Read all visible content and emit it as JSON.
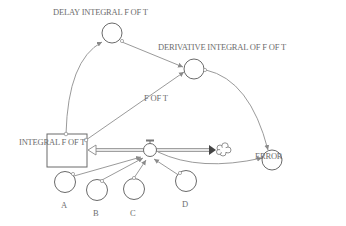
{
  "diagram": {
    "type": "stock-and-flow",
    "colors": {
      "line": "#8a8a8a",
      "text": "#6e6e6e",
      "flow": "#9a9a9a",
      "arrowhead": "#444444"
    },
    "stock": {
      "id": "integral",
      "label": "INTEGRAL F OF T"
    },
    "flow": {
      "id": "fot",
      "label": "F OF T"
    },
    "cloud": {
      "id": "sink",
      "label": ""
    },
    "auxiliaries": [
      {
        "id": "delay",
        "label": "DELAY INTEGRAL F OF T"
      },
      {
        "id": "deriv",
        "label": "DERIVATIVE INTEGRAL OF F OF T"
      },
      {
        "id": "error",
        "label": "ERROR"
      },
      {
        "id": "a",
        "label": "A"
      },
      {
        "id": "b",
        "label": "B"
      },
      {
        "id": "c",
        "label": "C"
      },
      {
        "id": "d",
        "label": "D"
      }
    ],
    "links": [
      {
        "from": "INTEGRAL F OF T",
        "to": "DELAY INTEGRAL F OF T"
      },
      {
        "from": "INTEGRAL F OF T",
        "to": "DERIVATIVE INTEGRAL OF F OF T"
      },
      {
        "from": "DELAY INTEGRAL F OF T",
        "to": "DERIVATIVE INTEGRAL OF F OF T"
      },
      {
        "from": "DERIVATIVE INTEGRAL OF F OF T",
        "to": "ERROR"
      },
      {
        "from": "F OF T",
        "to": "ERROR"
      },
      {
        "from": "A",
        "to": "F OF T"
      },
      {
        "from": "B",
        "to": "F OF T"
      },
      {
        "from": "C",
        "to": "F OF T"
      },
      {
        "from": "D",
        "to": "F OF T"
      }
    ]
  }
}
